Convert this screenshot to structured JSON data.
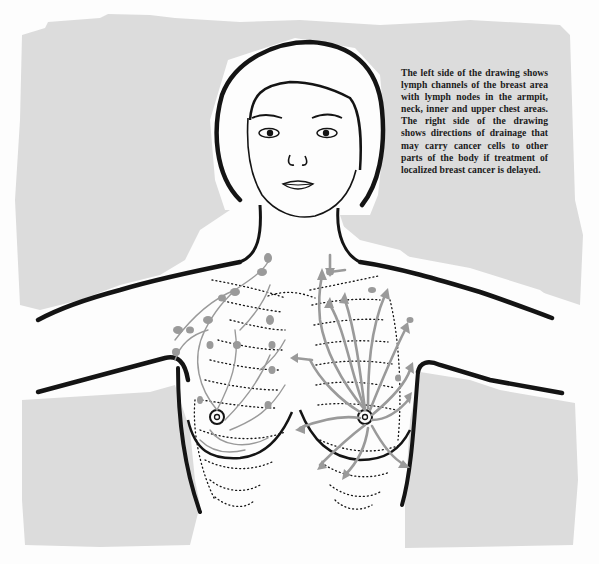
{
  "illustration": {
    "subject": "Front view of a woman's head, neck and upper torso with breast lymph anatomy",
    "colors": {
      "background_panel": "#dcdcdc",
      "ink": "#141414",
      "lymph": "#9a9a9a",
      "paper": "#fdfdfd"
    },
    "left_side_label": "lymph channels and lymph nodes",
    "right_side_label": "directions of drainage"
  },
  "caption": {
    "text": "The left side of the drawing shows lymph channels of the breast area with lymph nodes in the armpit, neck, inner and upper chest areas. The right side of the drawing shows directions of drainage that may carry cancer cells to other parts of the body if treatment of localized breast cancer is delayed."
  }
}
